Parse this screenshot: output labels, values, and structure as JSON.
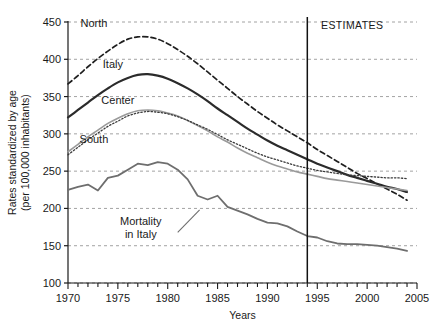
{
  "chart_data": {
    "type": "line",
    "title": "",
    "xlabel": "Years",
    "ylabel": "Rates standardized by age (per 100,000 inhabitants)",
    "ylabel_line1": "Rates standardized by age",
    "ylabel_line2": "(per 100,000 inhabitants)",
    "xlim": [
      1970,
      2005
    ],
    "ylim": [
      100,
      450
    ],
    "yticks": [
      100,
      150,
      200,
      250,
      300,
      350,
      400,
      450
    ],
    "xticks": [
      1970,
      1975,
      1980,
      1985,
      1990,
      1995,
      2000,
      2005
    ],
    "xtick_minor_step": 1,
    "grid": "horizontal-dashed",
    "legend": "inline-labels",
    "annotations": [
      {
        "name": "estimates-label",
        "text": "ESTIMATES",
        "x": 1998.5,
        "y": 440
      },
      {
        "name": "estimates-divider",
        "text": "",
        "x": 1994,
        "type": "vertical-line"
      },
      {
        "name": "mortality-leader",
        "text": "",
        "type": "leader-line",
        "from": [
          1983.2,
          198
        ],
        "to": [
          1981.0,
          168
        ]
      }
    ],
    "series": [
      {
        "name": "North",
        "label": "North",
        "label_x": 1972.6,
        "label_y": 443,
        "style": "dashed",
        "color": "#1f1f1f",
        "width": 1.7,
        "x": [
          1970,
          1971,
          1972,
          1973,
          1974,
          1975,
          1976,
          1977,
          1978,
          1979,
          1980,
          1981,
          1982,
          1983,
          1984,
          1985,
          1986,
          1987,
          1988,
          1989,
          1990,
          1991,
          1992,
          1993,
          1994,
          1995,
          1996,
          1997,
          1998,
          1999,
          2000,
          2001,
          2002,
          2003,
          2004
        ],
        "values": [
          367,
          378,
          390,
          401,
          411,
          420,
          427,
          430,
          430,
          427,
          421,
          413,
          404,
          394,
          383,
          372,
          361,
          350,
          340,
          330,
          321,
          312,
          304,
          296,
          288,
          279,
          271,
          263,
          255,
          247,
          240,
          233,
          226,
          219,
          211
        ]
      },
      {
        "name": "Italy",
        "label": "Italy",
        "label_x": 1974.5,
        "label_y": 388,
        "style": "solid",
        "color": "#2b2b2b",
        "width": 2.2,
        "x": [
          1970,
          1971,
          1972,
          1973,
          1974,
          1975,
          1976,
          1977,
          1978,
          1979,
          1980,
          1981,
          1982,
          1983,
          1984,
          1985,
          1986,
          1987,
          1988,
          1989,
          1990,
          1991,
          1992,
          1993,
          1994,
          1995,
          1996,
          1997,
          1998,
          1999,
          2000,
          2001,
          2002,
          2003,
          2004
        ],
        "values": [
          322,
          332,
          342,
          352,
          361,
          369,
          375,
          379,
          380,
          378,
          374,
          368,
          361,
          353,
          344,
          334,
          325,
          316,
          307,
          299,
          291,
          284,
          278,
          272,
          266,
          260,
          255,
          250,
          245,
          241,
          237,
          233,
          229,
          226,
          222
        ]
      },
      {
        "name": "Center",
        "label": "Center",
        "label_x": 1975.0,
        "label_y": 340,
        "style": "solid-light",
        "color": "#9a9a9a",
        "width": 1.6,
        "x": [
          1970,
          1971,
          1972,
          1973,
          1974,
          1975,
          1976,
          1977,
          1978,
          1979,
          1980,
          1981,
          1982,
          1983,
          1984,
          1985,
          1986,
          1987,
          1988,
          1989,
          1990,
          1991,
          1992,
          1993,
          1994,
          1995,
          1996,
          1997,
          1998,
          1999,
          2000,
          2001,
          2002,
          2003,
          2004
        ],
        "values": [
          276,
          286,
          296,
          305,
          314,
          321,
          327,
          331,
          332,
          331,
          328,
          324,
          318,
          311,
          304,
          296,
          289,
          281,
          274,
          268,
          262,
          257,
          253,
          249,
          246,
          243,
          240,
          238,
          236,
          234,
          232,
          230,
          228,
          226,
          224
        ]
      },
      {
        "name": "South",
        "label": "South",
        "label_x": 1972.6,
        "label_y": 288,
        "style": "dotted",
        "color": "#3a3a3a",
        "width": 1.3,
        "x": [
          1970,
          1971,
          1972,
          1973,
          1974,
          1975,
          1976,
          1977,
          1978,
          1979,
          1980,
          1981,
          1982,
          1983,
          1984,
          1985,
          1986,
          1987,
          1988,
          1989,
          1990,
          1991,
          1992,
          1993,
          1994,
          1995,
          1996,
          1997,
          1998,
          1999,
          2000,
          2001,
          2002,
          2003,
          2004
        ],
        "values": [
          272,
          282,
          292,
          301,
          310,
          317,
          324,
          328,
          330,
          329,
          327,
          323,
          318,
          312,
          306,
          299,
          292,
          286,
          280,
          274,
          269,
          265,
          261,
          257,
          254,
          251,
          249,
          247,
          245,
          244,
          243,
          242,
          241,
          241,
          240
        ]
      },
      {
        "name": "Mortality in Italy",
        "label": "Mortality\nin Italy",
        "label_line1": "Mortality",
        "label_line2": "in Italy",
        "label_x": 1977.3,
        "label_y": 178,
        "style": "solid-grey",
        "color": "#6e6e6e",
        "width": 1.8,
        "x": [
          1970,
          1971,
          1972,
          1973,
          1974,
          1975,
          1976,
          1977,
          1978,
          1979,
          1980,
          1981,
          1982,
          1983,
          1984,
          1985,
          1986,
          1987,
          1988,
          1989,
          1990,
          1991,
          1992,
          1993,
          1994,
          1995,
          1996,
          1997,
          1998,
          1999,
          2000,
          2001,
          2002,
          2003,
          2004
        ],
        "values": [
          225,
          229,
          232,
          224,
          241,
          244,
          252,
          260,
          258,
          262,
          260,
          252,
          239,
          217,
          212,
          217,
          202,
          197,
          192,
          186,
          181,
          180,
          176,
          169,
          163,
          161,
          156,
          153,
          152,
          152,
          151,
          150,
          148,
          146,
          143
        ]
      }
    ]
  }
}
